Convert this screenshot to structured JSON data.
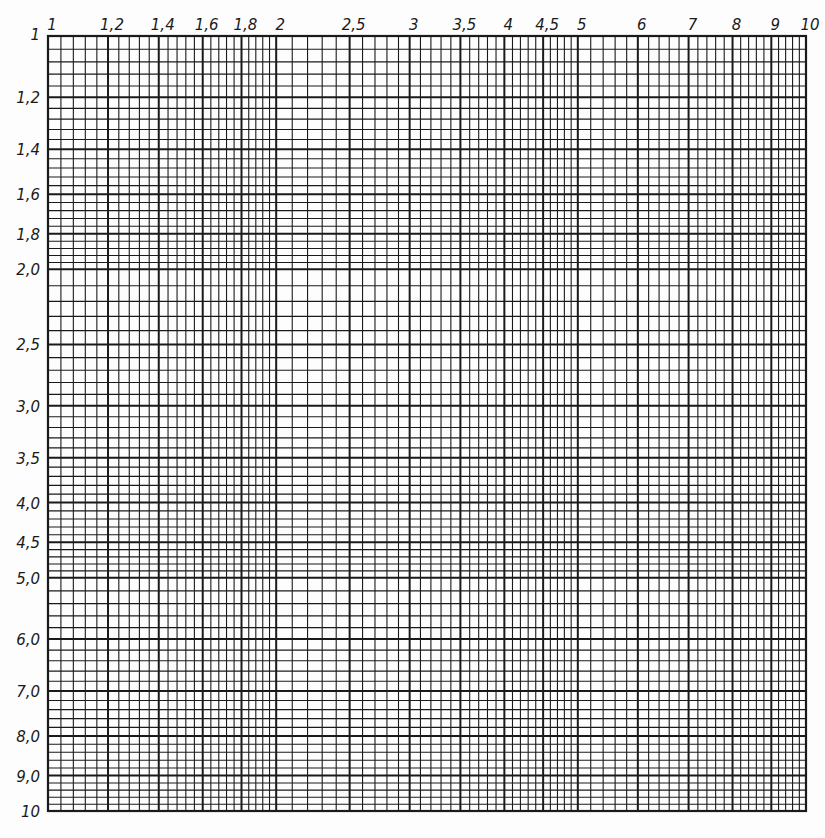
{
  "chart_data": {
    "type": "log-log grid paper",
    "title": "",
    "xlabel": "",
    "ylabel": "",
    "x_scale": "log",
    "y_scale": "log",
    "xlim": [
      1,
      10
    ],
    "ylim": [
      1,
      10
    ],
    "y_direction": "downward",
    "grid": true,
    "legend": null,
    "series": [],
    "x_tick_labels": [
      "1",
      "1,2",
      "1,4",
      "1,6",
      "1,8",
      "2",
      "2,5",
      "3",
      "3,5",
      "4",
      "4,5",
      "5",
      "6",
      "7",
      "8",
      "9",
      "10"
    ],
    "x_tick_values": [
      1,
      1.2,
      1.4,
      1.6,
      1.8,
      2,
      2.5,
      3,
      3.5,
      4,
      4.5,
      5,
      6,
      7,
      8,
      9,
      10
    ],
    "y_tick_labels": [
      "1",
      "1,2",
      "1,4",
      "1,6",
      "1,8",
      "2,0",
      "2,5",
      "3,0",
      "3,5",
      "4,0",
      "4,5",
      "5,0",
      "6,0",
      "7,0",
      "8,0",
      "9,0",
      "10"
    ],
    "y_tick_values": [
      1,
      1.2,
      1.4,
      1.6,
      1.8,
      2,
      2.5,
      3,
      3.5,
      4,
      4.5,
      5,
      6,
      7,
      8,
      9,
      10
    ],
    "minor_subdivisions": [
      {
        "from": 1,
        "to": 2,
        "step": 0.04
      },
      {
        "from": 2,
        "to": 5,
        "step": 0.1
      },
      {
        "from": 5,
        "to": 10,
        "step": 0.2
      }
    ]
  },
  "style": {
    "line_color": "#1a1a1a",
    "paper_color": "#fdfdfd"
  },
  "layout": {
    "plot_left": 48,
    "plot_top": 36,
    "plot_right": 806,
    "plot_bottom": 811
  }
}
